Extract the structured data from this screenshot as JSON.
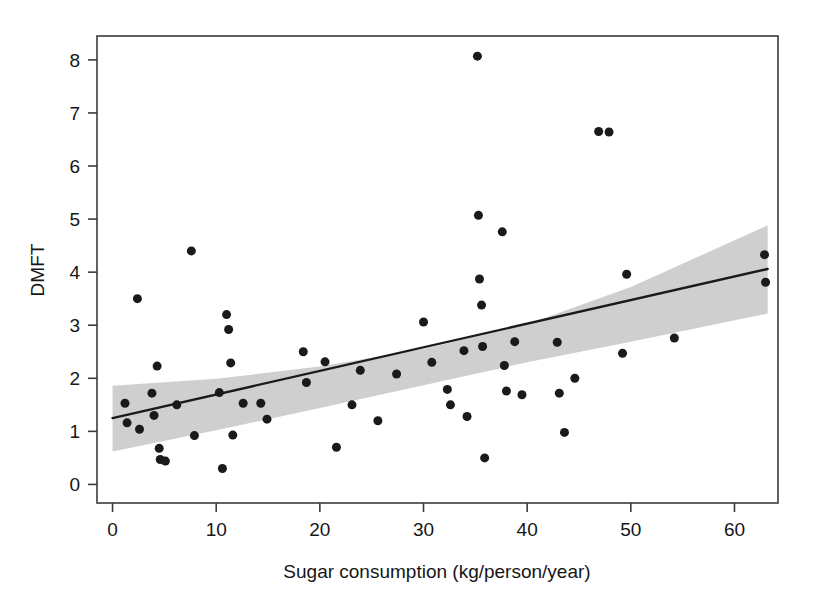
{
  "chart_data": {
    "type": "scatter",
    "title": "",
    "xlabel": "Sugar consumption (kg/person/year)",
    "ylabel": "DMFT",
    "xlim": [
      -1.5,
      64.2
    ],
    "ylim": [
      -0.35,
      8.45
    ],
    "xticks": [
      0,
      10,
      20,
      30,
      40,
      50,
      60
    ],
    "xticklabels": [
      "0",
      "10",
      "20",
      "30",
      "40",
      "50",
      "60"
    ],
    "yticks": [
      0,
      1,
      2,
      3,
      4,
      5,
      6,
      7,
      8
    ],
    "yticklabels": [
      "0",
      "1",
      "2",
      "3",
      "4",
      "5",
      "6",
      "7",
      "8"
    ],
    "grid": false,
    "legend": null,
    "marker_color": "#1a1a1a",
    "marker_size_px": 9,
    "line_color": "#1a1a1a",
    "band_color": "#cfcfcf",
    "frame_color": "#3b3b3b",
    "points": [
      {
        "x": 1.2,
        "y": 1.53
      },
      {
        "x": 1.4,
        "y": 1.16
      },
      {
        "x": 2.4,
        "y": 3.5
      },
      {
        "x": 2.6,
        "y": 1.04
      },
      {
        "x": 3.8,
        "y": 1.72
      },
      {
        "x": 4.0,
        "y": 1.3
      },
      {
        "x": 4.3,
        "y": 2.23
      },
      {
        "x": 4.5,
        "y": 0.68
      },
      {
        "x": 4.6,
        "y": 0.47
      },
      {
        "x": 5.1,
        "y": 0.44
      },
      {
        "x": 6.2,
        "y": 1.5
      },
      {
        "x": 7.6,
        "y": 4.4
      },
      {
        "x": 7.9,
        "y": 0.92
      },
      {
        "x": 10.3,
        "y": 1.73
      },
      {
        "x": 10.6,
        "y": 0.3
      },
      {
        "x": 11.0,
        "y": 3.2
      },
      {
        "x": 11.2,
        "y": 2.92
      },
      {
        "x": 11.4,
        "y": 2.29
      },
      {
        "x": 11.6,
        "y": 0.93
      },
      {
        "x": 12.6,
        "y": 1.53
      },
      {
        "x": 14.3,
        "y": 1.53
      },
      {
        "x": 14.9,
        "y": 1.23
      },
      {
        "x": 18.4,
        "y": 2.5
      },
      {
        "x": 18.7,
        "y": 1.92
      },
      {
        "x": 20.5,
        "y": 2.31
      },
      {
        "x": 21.6,
        "y": 0.7
      },
      {
        "x": 23.1,
        "y": 1.5
      },
      {
        "x": 23.9,
        "y": 2.15
      },
      {
        "x": 25.6,
        "y": 1.2
      },
      {
        "x": 27.4,
        "y": 2.08
      },
      {
        "x": 30.0,
        "y": 3.06
      },
      {
        "x": 30.8,
        "y": 2.3
      },
      {
        "x": 32.3,
        "y": 1.79
      },
      {
        "x": 32.6,
        "y": 1.5
      },
      {
        "x": 33.9,
        "y": 2.52
      },
      {
        "x": 34.2,
        "y": 1.28
      },
      {
        "x": 35.2,
        "y": 8.07
      },
      {
        "x": 35.3,
        "y": 5.07
      },
      {
        "x": 35.4,
        "y": 3.87
      },
      {
        "x": 35.6,
        "y": 3.38
      },
      {
        "x": 35.7,
        "y": 2.6
      },
      {
        "x": 35.9,
        "y": 0.5
      },
      {
        "x": 37.6,
        "y": 4.76
      },
      {
        "x": 37.8,
        "y": 2.24
      },
      {
        "x": 38.0,
        "y": 1.76
      },
      {
        "x": 38.8,
        "y": 2.69
      },
      {
        "x": 39.5,
        "y": 1.69
      },
      {
        "x": 42.9,
        "y": 2.68
      },
      {
        "x": 43.1,
        "y": 1.72
      },
      {
        "x": 43.6,
        "y": 0.98
      },
      {
        "x": 44.6,
        "y": 2.0
      },
      {
        "x": 46.9,
        "y": 6.65
      },
      {
        "x": 47.9,
        "y": 6.64
      },
      {
        "x": 49.2,
        "y": 2.47
      },
      {
        "x": 49.6,
        "y": 3.96
      },
      {
        "x": 54.2,
        "y": 2.76
      },
      {
        "x": 62.9,
        "y": 4.33
      },
      {
        "x": 63.0,
        "y": 3.81
      }
    ],
    "fit_line": {
      "x": [
        0.0,
        63.2
      ],
      "y": [
        1.25,
        4.06
      ]
    },
    "confidence_band": {
      "x": [
        0.0,
        10.0,
        20.0,
        30.0,
        40.0,
        50.0,
        63.2
      ],
      "upper": [
        1.86,
        1.99,
        2.22,
        2.55,
        3.02,
        3.72,
        4.88
      ],
      "lower": [
        0.62,
        1.02,
        1.44,
        1.87,
        2.3,
        2.69,
        3.22
      ]
    }
  }
}
